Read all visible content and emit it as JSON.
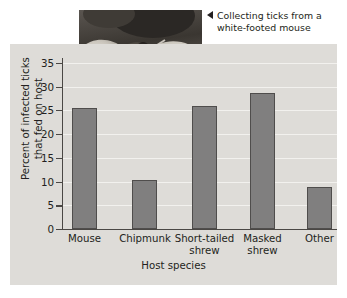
{
  "caption": {
    "marker": "left-triangle",
    "line1": "Collecting ticks from a",
    "line2": "white-footed mouse"
  },
  "photo": {
    "alt": "Gloved hands holding a white-footed mouse being examined for ticks"
  },
  "chart_data": {
    "type": "bar",
    "title": "",
    "xlabel": "Host species",
    "ylabel": "Percent of infected ticks that fed on host",
    "ylabel_line1": "Percent of infected ticks",
    "ylabel_line2": "that fed on host",
    "categories": [
      "Mouse",
      "Chipmunk",
      "Short-tailed shrew",
      "Masked shrew",
      "Other"
    ],
    "category_lines": [
      [
        "Mouse"
      ],
      [
        "Chipmunk"
      ],
      [
        "Short-tailed",
        "shrew"
      ],
      [
        "Masked",
        "shrew"
      ],
      [
        "Other"
      ]
    ],
    "values": [
      25.4,
      10.4,
      25.9,
      28.7,
      8.8
    ],
    "ylim": [
      0,
      37
    ],
    "yticks": [
      0,
      5,
      10,
      15,
      20,
      25,
      30,
      35
    ],
    "ytick_labels": [
      "0",
      "5",
      "10",
      "15",
      "20",
      "25",
      "30",
      "35"
    ],
    "grid": true,
    "legend": "none",
    "bar_color": "#807f7f",
    "bar_edge_color": "#4f4d4c",
    "panel_color": "#dedcd8",
    "gridline_color": "#f2f1ee",
    "axis_color": "#4a4744"
  }
}
